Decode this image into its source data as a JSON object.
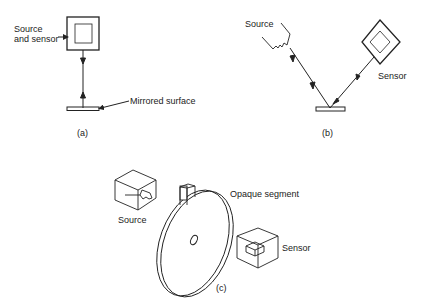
{
  "panel_a": {
    "label_source_sensor_line1": "Source",
    "label_source_sensor_line2": "and sensor",
    "label_mirror": "Mirrored surface",
    "caption": "(a)"
  },
  "panel_b": {
    "label_source": "Source",
    "label_sensor": "Sensor",
    "caption": "(b)"
  },
  "panel_c": {
    "label_source": "Source",
    "label_opaque": "Opaque segment",
    "label_sensor": "Sensor",
    "caption": "(c)"
  },
  "colors": {
    "line": "#222222",
    "background": "#ffffff"
  }
}
